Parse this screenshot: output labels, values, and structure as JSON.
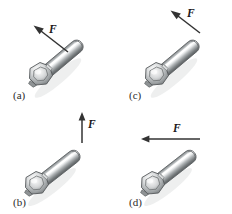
{
  "figure": {
    "name": "wrench-force-direction-figure",
    "background_color": "#ffffff",
    "force_symbol": "F",
    "panels": [
      {
        "id": "a",
        "label": "(a)",
        "force_label": "F",
        "force_direction": "up-left",
        "force_angle_deg": 135,
        "arrow_origin": "mid-shaft",
        "label_position": "bottom-left"
      },
      {
        "id": "b",
        "label": "(b)",
        "force_label": "F",
        "force_direction": "up",
        "force_angle_deg": 90,
        "arrow_origin": "shaft-tip",
        "label_position": "bottom-left"
      },
      {
        "id": "c",
        "label": "(c)",
        "force_label": "F",
        "force_direction": "up-left",
        "force_angle_deg": 140,
        "arrow_origin": "shaft-tip",
        "label_position": "bottom-left"
      },
      {
        "id": "d",
        "label": "(d)",
        "force_label": "F",
        "force_direction": "left",
        "force_angle_deg": 180,
        "arrow_origin": "shaft-tip",
        "label_position": "bottom-left"
      }
    ],
    "wrench": {
      "type": "box-end-wrench",
      "orientation": "head-lower-left-handle-upper-right",
      "shaft_angle_deg": 35,
      "colors": {
        "metal_light": "#fdfdfd",
        "metal_mid": "#b9bcbe",
        "metal_dark": "#6e7375",
        "metal_shadow": "#4d5153",
        "outline": "#55585a",
        "arrow": "#333333",
        "label_text": "#2b2b2b"
      }
    }
  }
}
